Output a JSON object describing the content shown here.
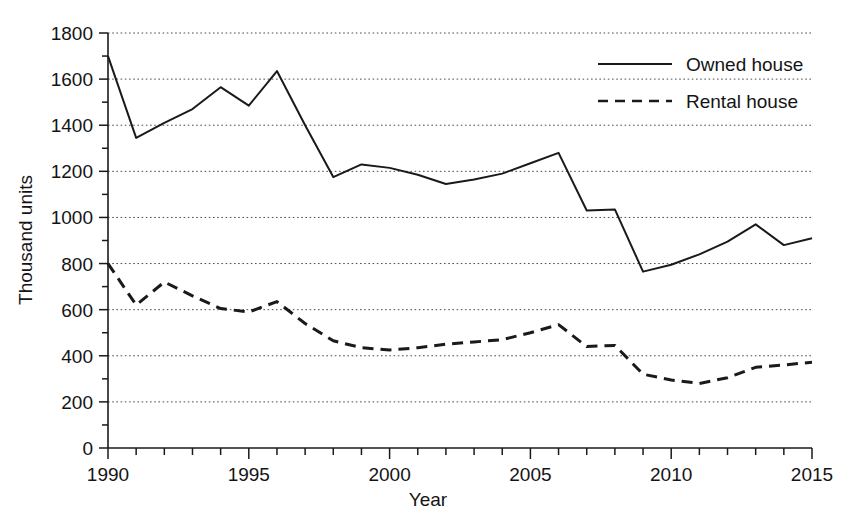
{
  "chart_data": {
    "type": "line",
    "title": "",
    "xlabel": "Year",
    "ylabel": "Thousand units",
    "xlim": [
      1990,
      2015
    ],
    "ylim": [
      0,
      1800
    ],
    "ytick_step": 200,
    "xtick_major_step": 5,
    "xtick_minor_step": 1,
    "grid": true,
    "grid_axis": "y",
    "grid_style": "dotted",
    "legend_position": "top-right",
    "x": [
      1990,
      1991,
      1992,
      1993,
      1994,
      1995,
      1996,
      1997,
      1998,
      1999,
      2000,
      2001,
      2002,
      2003,
      2004,
      2005,
      2006,
      2007,
      2008,
      2009,
      2010,
      2011,
      2012,
      2013,
      2014,
      2015
    ],
    "xticklabels": [
      "1990",
      "1995",
      "2000",
      "2005",
      "2010",
      "2015"
    ],
    "xtick_values": [
      1990,
      1995,
      2000,
      2005,
      2010,
      2015
    ],
    "yticklabels": [
      "0",
      "200",
      "400",
      "600",
      "800",
      "1000",
      "1200",
      "1400",
      "1600",
      "1800"
    ],
    "ytick_values": [
      0,
      200,
      400,
      600,
      800,
      1000,
      1200,
      1400,
      1600,
      1800
    ],
    "series": [
      {
        "name": "Owned house",
        "style": "solid",
        "color": "#1a1a1a",
        "values": [
          1700,
          1345,
          1410,
          1470,
          1565,
          1485,
          1635,
          1400,
          1175,
          1230,
          1215,
          1185,
          1145,
          1165,
          1190,
          1235,
          1280,
          1030,
          1035,
          765,
          795,
          840,
          895,
          970,
          880,
          910
        ]
      },
      {
        "name": "Rental house",
        "style": "dashed",
        "color": "#1a1a1a",
        "values": [
          800,
          620,
          720,
          660,
          605,
          590,
          635,
          540,
          465,
          435,
          425,
          435,
          450,
          460,
          470,
          500,
          535,
          440,
          445,
          320,
          295,
          280,
          305,
          350,
          360,
          372
        ]
      }
    ]
  },
  "legend": {
    "items": [
      {
        "label": "Owned house",
        "style": "solid"
      },
      {
        "label": "Rental house",
        "style": "dashed"
      }
    ]
  }
}
